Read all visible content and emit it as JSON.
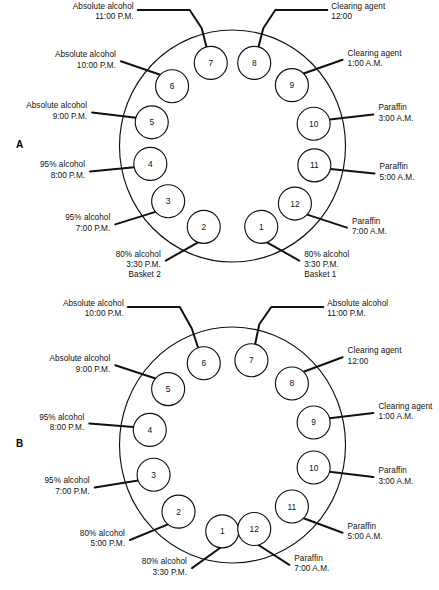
{
  "figure": {
    "panels": [
      {
        "letter": "A",
        "ellipse": {
          "cx": 232.5,
          "cy": 146,
          "rx": 113,
          "ry": 116
        },
        "ring_radius_x": 84,
        "ring_radius_y": 86,
        "circle_radius": 16.5,
        "stations": [
          {
            "number": "1",
            "angle_deg": 70,
            "side": "right",
            "lines": [
              "80% alcohol",
              "3:30 P.M.",
              "Basket 1"
            ]
          },
          {
            "number": "2",
            "angle_deg": 110,
            "side": "left",
            "lines": [
              "80% alcohol",
              "3:30 P.M.",
              "Basket 2"
            ]
          },
          {
            "number": "3",
            "angle_deg": 140,
            "side": "left",
            "lines": [
              "95% alcohol",
              "7:00 P.M."
            ]
          },
          {
            "number": "4",
            "angle_deg": 168,
            "side": "left",
            "lines": [
              "95% alcohol",
              "8:00 P.M."
            ]
          },
          {
            "number": "5",
            "angle_deg": 196,
            "side": "left",
            "lines": [
              "Absolute alcohol",
              "9:00 P.M."
            ]
          },
          {
            "number": "6",
            "angle_deg": 224,
            "side": "left",
            "lines": [
              "Absolute alcohol",
              "10:00 P.M."
            ]
          },
          {
            "number": "7",
            "angle_deg": 255,
            "side": "top",
            "lines": [
              "Absolute alcohol",
              "11:00 P.M."
            ]
          },
          {
            "number": "8",
            "angle_deg": 285,
            "side": "top",
            "lines": [
              "Clearing agent",
              "12:00"
            ]
          },
          {
            "number": "9",
            "angle_deg": 315,
            "side": "right",
            "lines": [
              "Clearing agent",
              "1:00 A.M."
            ]
          },
          {
            "number": "10",
            "angle_deg": 345,
            "side": "right",
            "lines": [
              "Paraffin",
              "3:00 A.M."
            ]
          },
          {
            "number": "11",
            "angle_deg": 13,
            "side": "right",
            "lines": [
              "Paraffin",
              "5:00 A.M."
            ]
          },
          {
            "number": "12",
            "angle_deg": 42,
            "side": "right",
            "lines": [
              "Paraffin",
              "7:00 A.M."
            ]
          }
        ]
      },
      {
        "letter": "B",
        "ellipse": {
          "cx": 232.5,
          "cy": 445,
          "rx": 113,
          "ry": 118
        },
        "ring_radius_x": 84,
        "ring_radius_y": 87,
        "circle_radius": 16.5,
        "stations": [
          {
            "number": "1",
            "angle_deg": 97,
            "side": "left",
            "lines": [
              "80% alcohol",
              "3:30 P.M."
            ]
          },
          {
            "number": "2",
            "angle_deg": 130,
            "side": "left",
            "lines": [
              "80% alcohol",
              "5:00 P.M."
            ]
          },
          {
            "number": "3",
            "angle_deg": 160,
            "side": "left",
            "lines": [
              "95% alcohol",
              "7:00 P.M."
            ]
          },
          {
            "number": "4",
            "angle_deg": 190,
            "side": "left",
            "lines": [
              "95% alcohol",
              "8:00 P.M."
            ]
          },
          {
            "number": "5",
            "angle_deg": 220,
            "side": "left",
            "lines": [
              "Absolute alcohol",
              "9:00 P.M."
            ]
          },
          {
            "number": "6",
            "angle_deg": 250,
            "side": "top",
            "lines": [
              "Absolute alcohol",
              "10:00 P.M."
            ]
          },
          {
            "number": "7",
            "angle_deg": 283,
            "side": "top",
            "lines": [
              "Absolute alcohol",
              "11:00 P.M."
            ]
          },
          {
            "number": "8",
            "angle_deg": 315,
            "side": "right",
            "lines": [
              "Clearing agent",
              "12:00"
            ]
          },
          {
            "number": "9",
            "angle_deg": 345,
            "side": "right",
            "lines": [
              "Clearing agent",
              "1:00 A.M."
            ]
          },
          {
            "number": "10",
            "angle_deg": 15,
            "side": "right",
            "lines": [
              "Paraffin",
              "3:00 A.M."
            ]
          },
          {
            "number": "11",
            "angle_deg": 45,
            "side": "right",
            "lines": [
              "Paraffin",
              "5:00 A.M."
            ]
          },
          {
            "number": "12",
            "angle_deg": 75,
            "side": "right",
            "lines": [
              "Paraffin",
              "7:00 A.M."
            ]
          }
        ]
      }
    ]
  },
  "style": {
    "stroke": "#111111",
    "background": "#ffffff",
    "line_width": 1.15,
    "leader_width": 2.0
  }
}
